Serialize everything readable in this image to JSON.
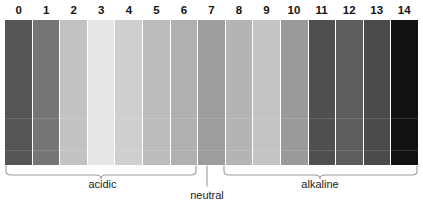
{
  "figure": {
    "name": "ph-scale",
    "orientation": "horizontal"
  },
  "chart_data": {
    "type": "bar",
    "xlabel": "",
    "ylabel": "",
    "categories": [
      "0",
      "1",
      "2",
      "3",
      "4",
      "5",
      "6",
      "7",
      "8",
      "9",
      "10",
      "11",
      "12",
      "13",
      "14"
    ],
    "values": [
      1,
      1,
      1,
      1,
      1,
      1,
      1,
      1,
      1,
      1,
      1,
      1,
      1,
      1,
      1
    ],
    "colors": [
      "#555555",
      "#757575",
      "#c2c2c2",
      "#e6e6e6",
      "#cfcfcf",
      "#bcbcbc",
      "#b0b0b0",
      "#9d9d9d",
      "#b4b4b4",
      "#c4c4c4",
      "#9a9a9a",
      "#4f4f4f",
      "#5d5d5d",
      "#4a4a4a",
      "#111111"
    ],
    "grid": false,
    "legend": "none",
    "annotations": [
      {
        "label": "acidic",
        "range": [
          0,
          6
        ]
      },
      {
        "label": "neutral",
        "range": [
          7,
          7
        ]
      },
      {
        "label": "alkaline",
        "range": [
          8,
          14
        ]
      }
    ]
  },
  "scale": {
    "numbers": [
      "0",
      "1",
      "2",
      "3",
      "4",
      "5",
      "6",
      "7",
      "8",
      "9",
      "10",
      "11",
      "12",
      "13",
      "14"
    ],
    "bands": [
      {
        "value": "0",
        "color": "#555555"
      },
      {
        "value": "1",
        "color": "#757575"
      },
      {
        "value": "2",
        "color": "#c2c2c2"
      },
      {
        "value": "3",
        "color": "#e6e6e6"
      },
      {
        "value": "4",
        "color": "#cfcfcf"
      },
      {
        "value": "5",
        "color": "#bcbcbc"
      },
      {
        "value": "6",
        "color": "#b0b0b0"
      },
      {
        "value": "7",
        "color": "#9d9d9d"
      },
      {
        "value": "8",
        "color": "#b4b4b4"
      },
      {
        "value": "9",
        "color": "#c4c4c4"
      },
      {
        "value": "10",
        "color": "#9a9a9a"
      },
      {
        "value": "11",
        "color": "#4f4f4f"
      },
      {
        "value": "12",
        "color": "#5d5d5d"
      },
      {
        "value": "13",
        "color": "#4a4a4a"
      },
      {
        "value": "14",
        "color": "#111111"
      }
    ]
  },
  "labels": {
    "acidic": "acidic",
    "neutral": "neutral",
    "alkaline": "alkaline"
  },
  "colors": {
    "background": "#ffffff",
    "text": "#1c1c1c",
    "number_text": "#141414",
    "brace_stroke": "#9a9a9a",
    "band_gap": "#ffffff"
  }
}
